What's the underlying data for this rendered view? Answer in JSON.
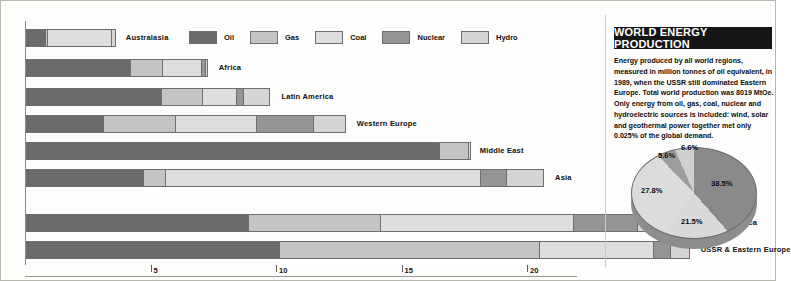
{
  "title": "WORLD ENERGY PRODUCTION",
  "blurb": "Energy produced by all world regions, measured in million tonnes of oil equivalent, in 1989, when the USSR still dominated Eastern Europe. Total world production was 8019 MtOe. Only energy from oil, gas, coal, nuclear and hydroelectric sources is included: wind, solar and geothermal power together met only 0.025% of the global demand.",
  "colors": {
    "oil": "#6b6b6b",
    "gas": "#c4c4c4",
    "coal": "#dedede",
    "nuclear": "#959595",
    "hydro": "#d5d5d5",
    "title_bg": "#151515",
    "title_fg": "#ffffff",
    "outline": "#6e6e6e",
    "background": "#fdfdfb"
  },
  "legend": {
    "items": [
      {
        "label": "Oil",
        "color": "#6b6b6b"
      },
      {
        "label": "Gas",
        "color": "#c4c4c4"
      },
      {
        "label": "Coal",
        "color": "#dedede"
      },
      {
        "label": "Nuclear",
        "color": "#959595"
      },
      {
        "label": "Hydro",
        "color": "#d5d5d5"
      }
    ]
  },
  "axis": {
    "ticks": [
      "5",
      "10",
      "15",
      "20"
    ],
    "tick_values": [
      5,
      10,
      15,
      20
    ],
    "min": 0,
    "max": 21.4
  },
  "chart_data": {
    "type": "bar",
    "orientation": "horizontal",
    "stacked": true,
    "title": "WORLD ENERGY PRODUCTION",
    "xlabel": "",
    "ylabel": "",
    "xlim": [
      0,
      21.4
    ],
    "grid": false,
    "legend_position": "top",
    "series": [
      {
        "name": "Oil",
        "color": "#6b6b6b",
        "values": [
          0.8,
          4.2,
          5.4,
          3.1,
          16.5,
          4.7,
          8.9,
          10.1
        ]
      },
      {
        "name": "Gas",
        "color": "#c4c4c4",
        "values": [
          0.1,
          1.3,
          1.7,
          2.9,
          1.2,
          0.9,
          5.3,
          10.4
        ]
      },
      {
        "name": "Coal",
        "color": "#dedede",
        "values": [
          2.6,
          1.6,
          1.4,
          3.3,
          0.1,
          12.6,
          7.7,
          4.6
        ]
      },
      {
        "name": "Nuclear",
        "color": "#959595",
        "values": [
          0.0,
          0.2,
          0.3,
          2.3,
          0.0,
          1.1,
          2.6,
          0.7
        ]
      },
      {
        "name": "Hydro",
        "color": "#d5d5d5",
        "values": [
          0.2,
          0.1,
          1.1,
          1.3,
          0.0,
          1.5,
          2.2,
          0.8
        ]
      }
    ],
    "categories": [
      "Australasia",
      "Africa",
      "Latin America",
      "Western Europe",
      "Middle East",
      "Asia",
      "North America",
      "USSR & Eastern Europe"
    ]
  },
  "pie": {
    "type": "pie",
    "labels": [
      "38.5%",
      "21.5%",
      "27.8%",
      "5.6%",
      "6.6%"
    ],
    "values": [
      38.5,
      21.5,
      27.8,
      5.6,
      6.6
    ],
    "slice_names": [
      "Oil",
      "Gas",
      "Coal",
      "Nuclear",
      "Hydro"
    ],
    "colors": [
      "#8a8a8a",
      "#d9d9d9",
      "#dcdcdc",
      "#9d9d9d",
      "#cfcfcf"
    ]
  }
}
